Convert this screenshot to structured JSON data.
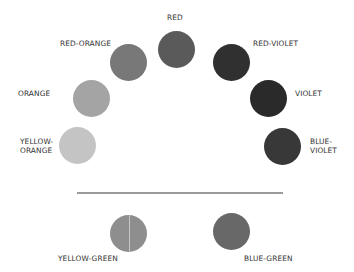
{
  "diagram": {
    "type": "color-wheel-half",
    "swatches": [
      {
        "name": "RED",
        "label": "RED",
        "color": "#5a5a5a",
        "cx": 177,
        "cy": 50
      },
      {
        "name": "RED-ORANGE",
        "label": "RED-ORANGE",
        "color": "#787878",
        "cx": 129,
        "cy": 62
      },
      {
        "name": "ORANGE",
        "label": "ORANGE",
        "color": "#a4a4a4",
        "cx": 92,
        "cy": 98
      },
      {
        "name": "YELLOW-ORANGE",
        "label_line1": "YELLOW-",
        "label_line2": "ORANGE",
        "color": "#c4c4c4",
        "cx": 78,
        "cy": 146
      },
      {
        "name": "RED-VIOLET",
        "label": "RED-VIOLET",
        "color": "#303030",
        "cx": 231,
        "cy": 62
      },
      {
        "name": "VIOLET",
        "label": "VIOLET",
        "color": "#2a2a2a",
        "cx": 268,
        "cy": 98
      },
      {
        "name": "BLUE-VIOLET",
        "label_line1": "BLUE-",
        "label_line2": "VIOLET",
        "color": "#383838",
        "cx": 282,
        "cy": 146
      },
      {
        "name": "YELLOW-GREEN",
        "label": "YELLOW-GREEN",
        "color": "#8e8e8e",
        "cx": 128,
        "cy": 233
      },
      {
        "name": "BLUE-GREEN",
        "label": "BLUE-GREEN",
        "color": "#686868",
        "cx": 231,
        "cy": 231
      }
    ],
    "divider_color": "#9a9a9a",
    "text_color": "#333333"
  }
}
